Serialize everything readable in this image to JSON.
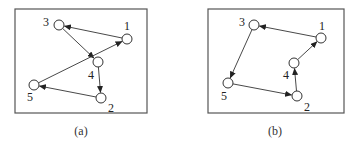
{
  "figure": {
    "panels": [
      {
        "id": "a",
        "caption": "(a)",
        "box": {
          "x": 15,
          "y": 9,
          "w": 132,
          "h": 104
        },
        "caption_pos": {
          "x": 81,
          "y": 135
        },
        "nodes": [
          {
            "id": "1",
            "label": "1",
            "x": 127,
            "y": 39,
            "lx": 124,
            "ly": 30
          },
          {
            "id": "2",
            "label": "2",
            "x": 101,
            "y": 98,
            "lx": 108,
            "ly": 112
          },
          {
            "id": "3",
            "label": "3",
            "x": 59,
            "y": 25,
            "lx": 43,
            "ly": 26
          },
          {
            "id": "4",
            "label": "4",
            "x": 98,
            "y": 62,
            "lx": 88,
            "ly": 79
          },
          {
            "id": "5",
            "label": "5",
            "x": 34,
            "y": 85,
            "lx": 27,
            "ly": 101
          }
        ],
        "edges": [
          {
            "from": "1",
            "to": "3"
          },
          {
            "from": "3",
            "to": "4"
          },
          {
            "from": "5",
            "to": "1"
          },
          {
            "from": "4",
            "to": "2"
          },
          {
            "from": "2",
            "to": "5"
          }
        ]
      },
      {
        "id": "b",
        "caption": "(b)",
        "box": {
          "x": 208,
          "y": 9,
          "w": 136,
          "h": 104
        },
        "caption_pos": {
          "x": 275,
          "y": 135
        },
        "nodes": [
          {
            "id": "1",
            "label": "1",
            "x": 321,
            "y": 38,
            "lx": 319,
            "ly": 30
          },
          {
            "id": "2",
            "label": "2",
            "x": 297,
            "y": 96,
            "lx": 304,
            "ly": 111
          },
          {
            "id": "3",
            "label": "3",
            "x": 254,
            "y": 25,
            "lx": 239,
            "ly": 26
          },
          {
            "id": "4",
            "label": "4",
            "x": 294,
            "y": 63,
            "lx": 283,
            "ly": 79
          },
          {
            "id": "5",
            "label": "5",
            "x": 228,
            "y": 83,
            "lx": 221,
            "ly": 100
          }
        ],
        "edges": [
          {
            "from": "1",
            "to": "3"
          },
          {
            "from": "3",
            "to": "5"
          },
          {
            "from": "5",
            "to": "2"
          },
          {
            "from": "2",
            "to": "4"
          },
          {
            "from": "4",
            "to": "1"
          }
        ]
      }
    ],
    "node_radius": 5,
    "colors": {
      "stroke": "#333333",
      "box": "#555555",
      "background": "#ffffff"
    }
  }
}
